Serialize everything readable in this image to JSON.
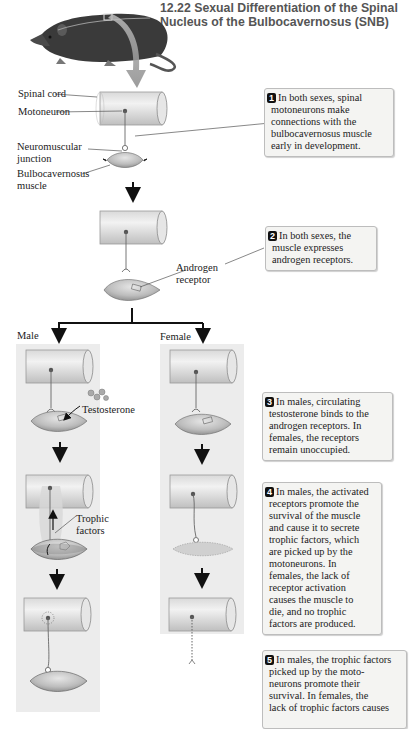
{
  "figure": {
    "title_line1": "12.22  Sexual Differentiation of the Spinal",
    "title_line2": "Nucleus of the Bulbocavernosus (SNB)"
  },
  "labels": {
    "spinal_cord": "Spinal cord",
    "motoneuron": "Motoneuron",
    "nmj_line1": "Neuromuscular",
    "nmj_line2": "junction",
    "muscle_line1": "Bulbocavernosus",
    "muscle_line2": "muscle",
    "androgen_line1": "Androgen",
    "androgen_line2": "receptor",
    "male": "Male",
    "female": "Female",
    "testosterone": "Testosterone",
    "trophic_line1": "Trophic",
    "trophic_line2": "factors"
  },
  "steps": [
    {
      "number": "1",
      "lines": [
        "In both sexes, spinal",
        "motoneurons make",
        "connections with the",
        "bulbocavernosus muscle",
        "early in development."
      ]
    },
    {
      "number": "2",
      "lines": [
        "In both sexes, the",
        "muscle expresses",
        "androgen receptors."
      ]
    },
    {
      "number": "3",
      "lines": [
        "In males, circulating",
        "testosterone binds to the",
        "androgen receptors. In",
        "females, the receptors",
        "remain unoccupied."
      ]
    },
    {
      "number": "4",
      "lines": [
        "In males, the activated",
        "receptors promote the",
        "survival of the muscle",
        "and cause it to secrete",
        "trophic factors, which",
        "are picked up by the",
        "motoneurons. In",
        "females, the lack of",
        "receptor activation",
        "causes the muscle to",
        "die, and no trophic",
        "factors are produced."
      ]
    },
    {
      "number": "5",
      "lines": [
        "In males, the trophic factors",
        "picked up by the moto-",
        "neurons promote their",
        "survival. In females, the",
        "lack of trophic factors causes"
      ]
    }
  ],
  "colors": {
    "panel_bg": "#ececec",
    "box_bg": "#f4f4f2",
    "arrow_gray": "#8a8a8a",
    "muscle_fill": "#c9c9c9",
    "title_gray": "#555555"
  }
}
